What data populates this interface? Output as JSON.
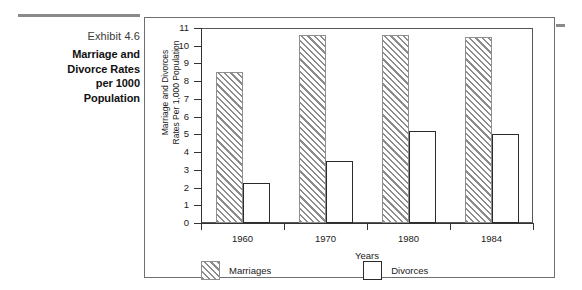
{
  "caption": {
    "exhibit_number": "Exhibit 4.6",
    "title_lines": [
      "Marriage and",
      "Divorce Rates",
      "per 1000",
      "Population"
    ],
    "rule_color": "#8a8a8a"
  },
  "chart_data": {
    "type": "bar",
    "title": "",
    "categories": [
      "1960",
      "1970",
      "1980",
      "1984"
    ],
    "series": [
      {
        "name": "Marriages",
        "values": [
          8.5,
          10.6,
          10.6,
          10.5
        ],
        "style": "hatched"
      },
      {
        "name": "Divorces",
        "values": [
          2.25,
          3.5,
          5.2,
          5.0
        ],
        "style": "outline"
      }
    ],
    "xlabel": "Years",
    "ylabel_lines": [
      "Marriage and Divorces",
      "Rates Per 1,000 Population"
    ],
    "ylim": [
      0,
      11
    ],
    "yticks": [
      "0",
      "1",
      "2",
      "3",
      "4",
      "5",
      "6",
      "7",
      "8",
      "9",
      "10",
      "11"
    ],
    "grid": false,
    "legend_position": "bottom-left",
    "colors": {
      "hatch": "#8c8c8c",
      "outline": "#2b2b2b",
      "axis": "#333333",
      "frame": "#6f6f6f"
    }
  }
}
